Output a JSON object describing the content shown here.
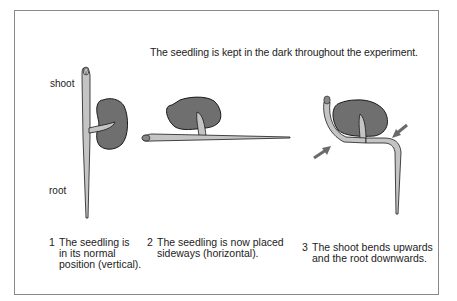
{
  "figure": {
    "title": "The seedling is kept in the dark throughout the experiment.",
    "labels": {
      "shoot": "shoot",
      "root": "root"
    },
    "panels": [
      {
        "number": "1",
        "caption": "The seedling is\nin its normal\nposition (vertical)."
      },
      {
        "number": "2",
        "caption": "The seedling is now placed\nsideways (horizontal)."
      },
      {
        "number": "3",
        "caption": "The shoot bends upwards\nand the root downwards."
      }
    ],
    "colors": {
      "seed": "#6f6f6f",
      "stem": "#c4c4c4",
      "outline": "#1a1a1a",
      "arrow": "#6a6a6a",
      "frame": "#8a8a8a"
    }
  }
}
